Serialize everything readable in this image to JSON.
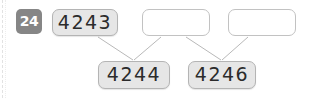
{
  "exercise": {
    "number_badge": "24"
  },
  "top_row": [
    {
      "id": "box-4243",
      "value": "4243",
      "filled": true,
      "x": 52,
      "y": 9,
      "w": 66,
      "h": 27
    },
    {
      "id": "box-blank-1",
      "value": "",
      "filled": false,
      "x": 142,
      "y": 9,
      "w": 68,
      "h": 27
    },
    {
      "id": "box-blank-2",
      "value": "",
      "filled": false,
      "x": 228,
      "y": 9,
      "w": 68,
      "h": 27
    }
  ],
  "bottom_row": [
    {
      "id": "box-4244",
      "value": "4244",
      "filled": true,
      "x": 98,
      "y": 61,
      "w": 72,
      "h": 28
    },
    {
      "id": "box-4246",
      "value": "4246",
      "filled": true,
      "x": 188,
      "y": 61,
      "w": 68,
      "h": 28
    }
  ],
  "connectors": [
    {
      "id": "line-4243-to-4244",
      "from": "box-4243",
      "to": "box-4244",
      "x1": 98,
      "y1": 37,
      "x2": 133,
      "y2": 60
    },
    {
      "id": "line-blank1-to-4244",
      "from": "box-blank-1",
      "to": "box-4244",
      "x1": 161,
      "y1": 37,
      "x2": 134,
      "y2": 60
    },
    {
      "id": "line-blank1-to-4246",
      "from": "box-blank-1",
      "to": "box-4246",
      "x1": 186,
      "y1": 37,
      "x2": 221,
      "y2": 60
    },
    {
      "id": "line-blank2-to-4246",
      "from": "box-blank-2",
      "to": "box-4246",
      "x1": 248,
      "y1": 37,
      "x2": 222,
      "y2": 60
    }
  ],
  "colors": {
    "badge_bg": "#868686",
    "badge_text": "#ffffff",
    "box_fill": "#e6e6e6",
    "box_border": "#b4b4b4",
    "box_empty_fill": "#ffffff",
    "text": "#2b2b2b",
    "connector": "#b9b9b9"
  }
}
